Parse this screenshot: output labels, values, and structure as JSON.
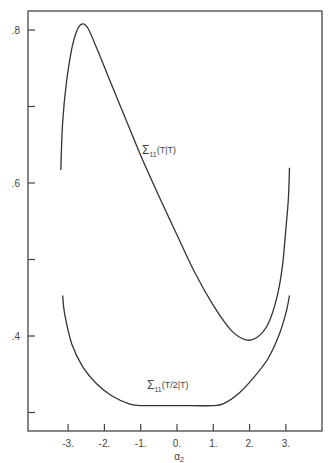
{
  "chart_data": {
    "type": "line",
    "title": "",
    "xlabel": "α₂",
    "ylabel": "",
    "xlim": [
      -3.85,
      4.05
    ],
    "ylim": [
      0.269,
      0.825
    ],
    "grid": false,
    "legend": "none (inline curve labels)",
    "x_ticks": [
      -3,
      -2,
      -1,
      0,
      1,
      2,
      3
    ],
    "x_tick_labels": [
      "-3.",
      "-2.",
      "-1.",
      "0.",
      "1.",
      "2.",
      "3."
    ],
    "y_ticks": [
      0.3,
      0.4,
      0.5,
      0.6,
      0.7,
      0.8
    ],
    "y_tick_labels": [
      "",
      ".4",
      "",
      ".6",
      "",
      ".8"
    ],
    "series": [
      {
        "name": "Σ11(T|T)",
        "label_main": "Σ",
        "label_sub": "11",
        "label_arg": "(T|T)",
        "x": [
          -3.2,
          -3.15,
          -3.05,
          -2.9,
          -2.75,
          -2.6,
          -2.45,
          -2.2,
          -1.8,
          -1.4,
          -1.0,
          -0.5,
          0,
          0.5,
          1.0,
          1.5,
          1.9,
          2.2,
          2.5,
          2.75,
          2.9,
          3.0,
          3.07,
          3.1
        ],
        "values": [
          0.617,
          0.68,
          0.73,
          0.775,
          0.8,
          0.808,
          0.802,
          0.775,
          0.728,
          0.682,
          0.636,
          0.583,
          0.532,
          0.482,
          0.44,
          0.407,
          0.395,
          0.398,
          0.415,
          0.45,
          0.49,
          0.54,
          0.58,
          0.62
        ]
      },
      {
        "name": "Σ11(T/2|T)",
        "label_main": "Σ",
        "label_sub": "11",
        "label_arg": "(T/2|T)",
        "x": [
          -3.15,
          -3.1,
          -2.9,
          -2.6,
          -2.2,
          -1.8,
          -1.3,
          -0.9,
          0,
          1.0,
          1.3,
          1.7,
          2.1,
          2.5,
          2.8,
          3.0,
          3.1
        ],
        "values": [
          0.453,
          0.43,
          0.39,
          0.36,
          0.337,
          0.322,
          0.311,
          0.309,
          0.309,
          0.309,
          0.312,
          0.325,
          0.345,
          0.37,
          0.4,
          0.43,
          0.453
        ]
      }
    ]
  }
}
